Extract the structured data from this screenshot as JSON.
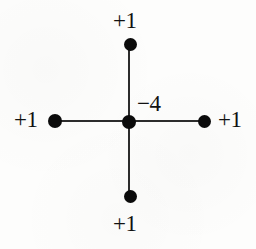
{
  "figure": {
    "name": "five-point-stencil",
    "background_color": "#fdfdfc",
    "ink_color": "#0b0b0b",
    "line_color": "#2c2c2c",
    "width": 256,
    "height": 249
  },
  "chart_data": {
    "type": "diagram",
    "title": "",
    "xlabel": "",
    "ylabel": "",
    "grid": false,
    "legend": null,
    "categories": [
      "center",
      "top",
      "bottom",
      "left",
      "right"
    ],
    "values": [
      -4,
      1,
      1,
      1,
      1
    ],
    "nodes": [
      {
        "id": "center",
        "label": "−4",
        "value": -4,
        "x": 129,
        "y": 122,
        "diameter": 14,
        "label_x": 137,
        "label_y": 92
      },
      {
        "id": "top",
        "label": "+1",
        "value": 1,
        "x": 130,
        "y": 44,
        "diameter": 13,
        "label_x": 113,
        "label_y": 9
      },
      {
        "id": "bottom",
        "label": "+1",
        "value": 1,
        "x": 130,
        "y": 196,
        "diameter": 13,
        "label_x": 113,
        "label_y": 212
      },
      {
        "id": "left",
        "label": "+1",
        "value": 1,
        "x": 55,
        "y": 121,
        "diameter": 14,
        "label_x": 14,
        "label_y": 108
      },
      {
        "id": "right",
        "label": "+1",
        "value": 1,
        "x": 204,
        "y": 121,
        "diameter": 13,
        "label_x": 218,
        "label_y": 108
      }
    ],
    "edges": [
      {
        "id": "horizontal",
        "from": "left",
        "to": "right",
        "x1": 55,
        "y1": 121,
        "x2": 204,
        "y2": 121
      },
      {
        "id": "vertical",
        "from": "top",
        "to": "bottom",
        "x1": 129,
        "y1": 44,
        "x2": 129,
        "y2": 196
      }
    ]
  },
  "labels": {
    "center_weight": "−4",
    "top_weight": "+1",
    "bottom_weight": "+1",
    "left_weight": "+1",
    "right_weight": "+1"
  }
}
